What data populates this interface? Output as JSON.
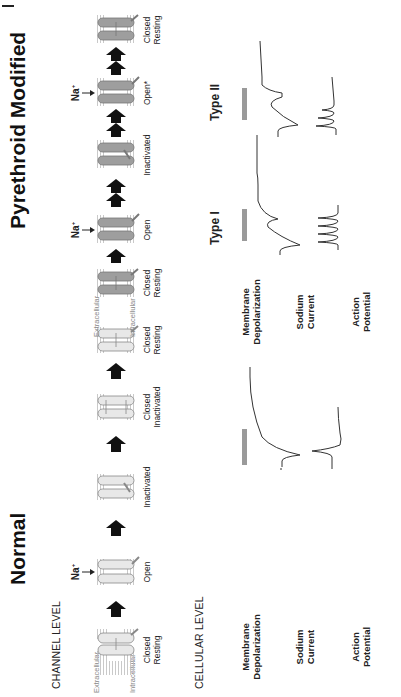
{
  "figure": {
    "orientation": "rotated-90-ccw",
    "colors": {
      "normal_channel_fill": "#e8e8e8",
      "modified_channel_fill": "#9e9e9e",
      "channel_stroke": "#777777",
      "arrow": "#111111",
      "depolarization_bar": "#9a9a9a",
      "trace": "#333333",
      "membrane_lines": "#aaaaaa"
    }
  },
  "normal": {
    "title": "Normal",
    "channel_level_label": "CHANNEL LEVEL",
    "cellular_level_label": "CELLULAR LEVEL",
    "membrane_side_labels": {
      "extracellular": "Extracellular",
      "intracellular": "Intracellular"
    },
    "ion_label": "Na",
    "ion_charge": "+",
    "states": [
      {
        "line1": "Closed",
        "line2": "Resting"
      },
      {
        "line1": "Open",
        "line2": ""
      },
      {
        "line1": "Inactivated",
        "line2": ""
      },
      {
        "line1": "Closed",
        "line2": "Inactivated"
      },
      {
        "line1": "Closed",
        "line2": "Resting"
      }
    ],
    "arrow_counts": [
      1,
      1,
      1,
      1
    ]
  },
  "pyrethroid": {
    "title": "Pyrethroid Modified",
    "membrane_side_labels": {
      "extracellular": "Extracellular",
      "intracellular": "Intracellular"
    },
    "ion_label": "Na",
    "ion_charge": "+",
    "states": [
      {
        "line1": "Closed",
        "line2": "Resting"
      },
      {
        "line1": "Open",
        "line2": ""
      },
      {
        "line1": "Inactivated",
        "line2": ""
      },
      {
        "line1": "Open*",
        "line2": ""
      },
      {
        "line1": "Closed",
        "line2": "Resting"
      }
    ],
    "arrow_counts": [
      1,
      2,
      2,
      2
    ],
    "type_labels": [
      "Type I",
      "Type II"
    ]
  },
  "cellular_rows": {
    "membrane_depolarization": {
      "line1": "Membrane",
      "line2": "Depolarization"
    },
    "sodium_current": {
      "line1": "Sodium",
      "line2": "Current"
    },
    "action_potential": {
      "line1": "Action",
      "line2": "Potential"
    }
  }
}
